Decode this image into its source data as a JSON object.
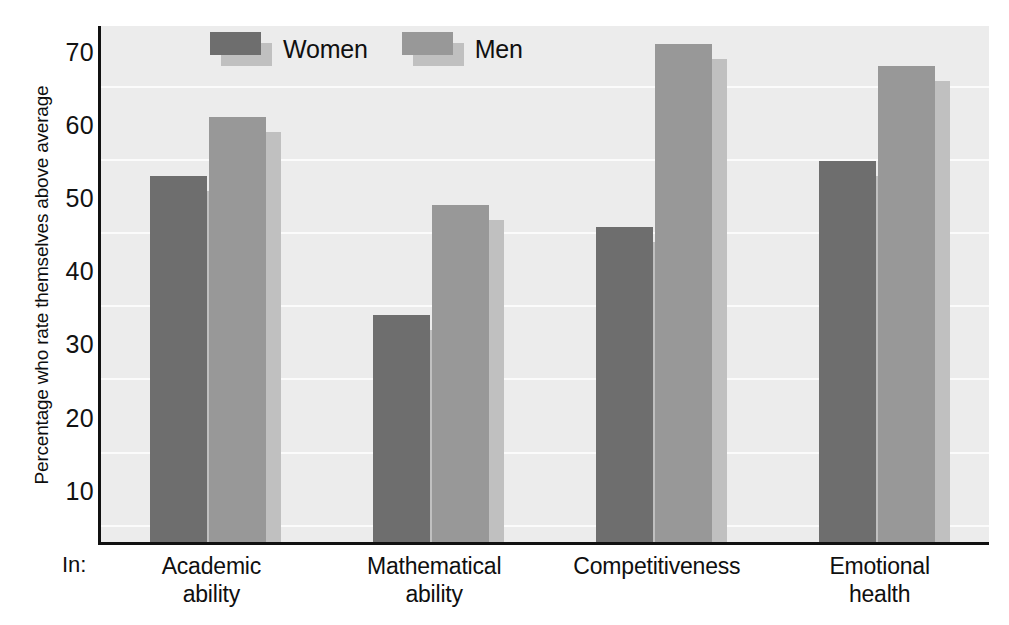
{
  "chart_data": {
    "type": "bar",
    "title": "",
    "subtitle": "",
    "xlabel": "In:",
    "ylabel": "Percentage who rate themselves above average",
    "categories": [
      "Academic\nability",
      "Mathematical\nability",
      "Competitiveness",
      "Emotional\nhealth"
    ],
    "category_labels": [
      [
        "Academic",
        "ability"
      ],
      [
        "Mathematical",
        "ability"
      ],
      [
        "Competitiveness",
        ""
      ],
      [
        "Emotional",
        "health"
      ]
    ],
    "series": [
      {
        "name": "Women",
        "values": [
          53,
          34,
          46,
          55
        ],
        "color": "#6e6e6e"
      },
      {
        "name": "Men",
        "values": [
          61,
          49,
          71,
          68
        ],
        "color": "#989898"
      }
    ],
    "legend": [
      "Women",
      "Men"
    ],
    "legend_position": "top-left-inside",
    "ylim": [
      0,
      74
    ],
    "yticks": [
      10,
      20,
      30,
      40,
      50,
      60,
      70
    ],
    "ytick_labels": [
      "10",
      "20",
      "30",
      "40",
      "50",
      "60",
      "70"
    ],
    "grid": true,
    "grid_axis": "y",
    "bar_shadow": true
  },
  "colors": {
    "plot_background": "#ececec",
    "gridline": "#fbfbfb",
    "axis": "#111111",
    "women": "#6e6e6e",
    "men": "#989898",
    "shadow": "#c0c0c0",
    "text": "#101010"
  },
  "axis": {
    "y_title": "Percentage who rate themselves above average",
    "x_prefix": "In:"
  }
}
